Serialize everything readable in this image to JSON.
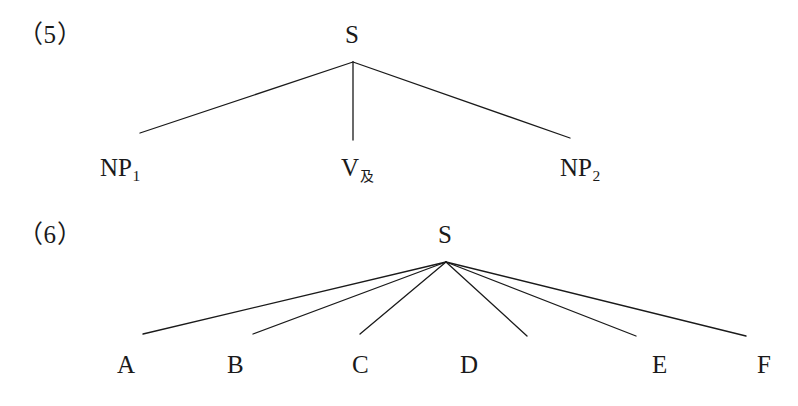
{
  "page": {
    "background_color": "#ffffff",
    "ink_color": "#1a1a1a",
    "width": 798,
    "height": 406
  },
  "figures": [
    {
      "id": "figure-5",
      "number_label": "（5）",
      "root": {
        "label": "S",
        "x": 353,
        "y": 44
      },
      "apex": {
        "x": 353,
        "y": 62
      },
      "branches": [
        {
          "name": "branch-np1",
          "x1": 353,
          "y1": 62,
          "x2": 140,
          "y2": 133
        },
        {
          "name": "branch-v",
          "x1": 353,
          "y1": 62,
          "x2": 353,
          "y2": 140
        },
        {
          "name": "branch-np2",
          "x1": 353,
          "y1": 62,
          "x2": 570,
          "y2": 138
        }
      ],
      "leaves": [
        {
          "name": "leaf-np1",
          "base": "NP",
          "sub": "1",
          "sub_type": "digit",
          "x": 100,
          "y": 155
        },
        {
          "name": "leaf-v",
          "base": "V",
          "sub": "及",
          "sub_type": "cjk",
          "x": 341,
          "y": 155
        },
        {
          "name": "leaf-np2",
          "base": "NP",
          "sub": "2",
          "sub_type": "digit",
          "x": 560,
          "y": 155
        }
      ]
    },
    {
      "id": "figure-6",
      "number_label": "（6）",
      "root": {
        "label": "S",
        "x": 446,
        "y": 244
      },
      "apex": {
        "x": 446,
        "y": 262
      },
      "branches": [
        {
          "name": "branch-a",
          "x1": 446,
          "y1": 262,
          "x2": 143,
          "y2": 334
        },
        {
          "name": "branch-b",
          "x1": 446,
          "y1": 262,
          "x2": 253,
          "y2": 334
        },
        {
          "name": "branch-c",
          "x1": 446,
          "y1": 262,
          "x2": 360,
          "y2": 334
        },
        {
          "name": "branch-d",
          "x1": 446,
          "y1": 262,
          "x2": 527,
          "y2": 336
        },
        {
          "name": "branch-e",
          "x1": 446,
          "y1": 262,
          "x2": 636,
          "y2": 336
        },
        {
          "name": "branch-f",
          "x1": 446,
          "y1": 262,
          "x2": 746,
          "y2": 336
        }
      ],
      "leaves": [
        {
          "name": "leaf-a",
          "base": "A",
          "sub": "",
          "sub_type": "none",
          "x": 117,
          "y": 352
        },
        {
          "name": "leaf-b",
          "base": "B",
          "sub": "",
          "sub_type": "none",
          "x": 227,
          "y": 352
        },
        {
          "name": "leaf-c",
          "base": "C",
          "sub": "",
          "sub_type": "none",
          "x": 352,
          "y": 352
        },
        {
          "name": "leaf-d",
          "base": "D",
          "sub": "",
          "sub_type": "none",
          "x": 460,
          "y": 352
        },
        {
          "name": "leaf-e",
          "base": "E",
          "sub": "",
          "sub_type": "none",
          "x": 652,
          "y": 352
        },
        {
          "name": "leaf-f",
          "base": "F",
          "sub": "",
          "sub_type": "none",
          "x": 757,
          "y": 352
        }
      ]
    }
  ],
  "numbers": {
    "five": {
      "text": "（5）",
      "x": 18,
      "y": 22
    },
    "six": {
      "text": "（6）",
      "x": 18,
      "y": 222
    }
  }
}
